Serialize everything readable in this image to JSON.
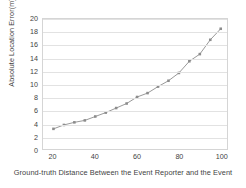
{
  "chart_data": {
    "type": "line",
    "title": "",
    "xlabel": "Ground-truth Distance Between the Event Reporter and the Event",
    "ylabel": "Absolute Location Error(m)",
    "xlim": [
      15,
      103
    ],
    "ylim": [
      0,
      20
    ],
    "xticks": [
      20,
      40,
      60,
      80,
      100
    ],
    "yticks": [
      0,
      2,
      4,
      6,
      8,
      10,
      12,
      14,
      16,
      18,
      20
    ],
    "grid": "horizontal",
    "legend": "none",
    "line_color": "#8c8c8c",
    "marker": "small-square",
    "x": [
      20,
      25,
      30,
      35,
      40,
      45,
      50,
      55,
      60,
      65,
      70,
      75,
      80,
      85,
      90,
      95,
      100
    ],
    "values": [
      3.1,
      3.7,
      4.1,
      4.4,
      5.0,
      5.6,
      6.3,
      7.0,
      8.0,
      8.6,
      9.6,
      10.5,
      11.7,
      13.5,
      14.6,
      16.8,
      18.5
    ],
    "series": [
      {
        "name": "Absolute Location Error",
        "values": [
          3.1,
          3.7,
          4.1,
          4.4,
          5.0,
          5.6,
          6.3,
          7.0,
          8.0,
          8.6,
          9.6,
          10.5,
          11.7,
          13.5,
          14.6,
          16.8,
          18.5
        ]
      }
    ]
  },
  "axis": {
    "y_title": "Absolute Location Error(m)",
    "x_title": "Ground-truth Distance Between the Event Reporter and the Event",
    "y_tick_labels": [
      "0",
      "2",
      "4",
      "6",
      "8",
      "10",
      "12",
      "14",
      "16",
      "18",
      "20"
    ],
    "x_tick_labels": [
      "20",
      "40",
      "60",
      "80",
      "100"
    ]
  },
  "colors": {
    "line": "#8c8c8c",
    "grid": "#e2e2e2",
    "border": "#d5d5d5",
    "text": "#3f3f3f",
    "background": "#ffffff"
  }
}
